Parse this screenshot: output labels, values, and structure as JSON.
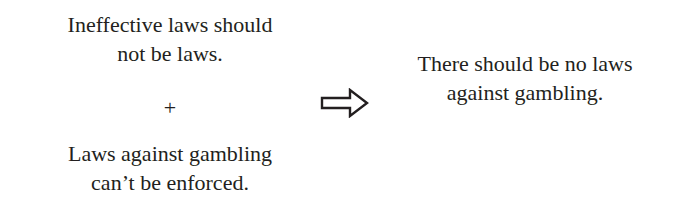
{
  "premises": [
    {
      "lines": [
        "Ineffective laws should",
        "not be laws."
      ]
    },
    {
      "lines": [
        "Laws against gambling",
        "can’t be enforced."
      ]
    }
  ],
  "operator": "+",
  "arrow_icon": "right-arrow-icon",
  "conclusion": {
    "lines": [
      "There should be no laws",
      "against gambling."
    ]
  }
}
